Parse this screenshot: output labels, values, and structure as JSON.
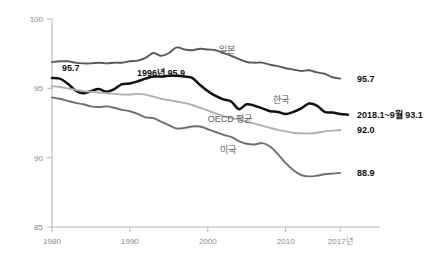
{
  "chart_data": {
    "type": "line",
    "title": "",
    "subtitle": "",
    "xlabel": "",
    "ylabel": "",
    "grid": false,
    "legend_position": "inline-series-labels",
    "xlim": [
      1980,
      2018
    ],
    "ylim": [
      85,
      100
    ],
    "x_tick_labels": [
      "1980",
      "1990",
      "2000",
      "2010",
      "2017년"
    ],
    "x_tick_values": [
      1980,
      1990,
      2000,
      2010,
      2017
    ],
    "y_tick_labels": [
      "100",
      "95",
      "90",
      "85"
    ],
    "y_tick_values": [
      100,
      95,
      90,
      85
    ],
    "annotations": [
      {
        "name": "korea-start-value",
        "text": "95.7",
        "x": 1982.4,
        "y": 96.45
      },
      {
        "name": "korea-peak-value",
        "text": "1996년 95.9",
        "x": 1994.0,
        "y": 96.1
      },
      {
        "name": "japan-end-value",
        "text": "95.7",
        "x": 2018.6,
        "y": 95.7
      },
      {
        "name": "korea-end-value",
        "text": "2018.1~9월 93.1",
        "x": 2018.6,
        "y": 93.1
      },
      {
        "name": "oecd-end-value",
        "text": "92.0",
        "x": 2018.6,
        "y": 92.0
      },
      {
        "name": "usa-end-value",
        "text": "88.9",
        "x": 2018.6,
        "y": 88.9
      }
    ],
    "series": [
      {
        "name": "japan",
        "label": "일본",
        "color": "#5a5a5a",
        "width": 1.9,
        "label_x": 2001.5,
        "label_y": 97.55,
        "x": [
          1980,
          1981,
          1982,
          1983,
          1984,
          1985,
          1986,
          1987,
          1988,
          1989,
          1990,
          1991,
          1992,
          1993,
          1994,
          1995,
          1996,
          1997,
          1998,
          1999,
          2000,
          2001,
          2002,
          2003,
          2004,
          2005,
          2006,
          2007,
          2008,
          2009,
          2010,
          2011,
          2012,
          2013,
          2014,
          2015,
          2016,
          2017
        ],
        "values": [
          96.9,
          96.95,
          96.95,
          96.85,
          96.8,
          96.8,
          96.85,
          96.8,
          96.85,
          96.85,
          96.95,
          97.0,
          97.2,
          97.55,
          97.35,
          97.55,
          97.95,
          97.8,
          97.75,
          97.85,
          97.8,
          97.75,
          97.55,
          97.35,
          97.1,
          96.9,
          96.85,
          96.85,
          96.7,
          96.6,
          96.45,
          96.35,
          96.25,
          96.3,
          96.15,
          96.05,
          95.8,
          95.7
        ]
      },
      {
        "name": "korea",
        "label": "한국",
        "color": "#111111",
        "width": 2.5,
        "label_x": 2008.4,
        "label_y": 93.95,
        "x": [
          1980,
          1981,
          1982,
          1983,
          1984,
          1985,
          1986,
          1987,
          1988,
          1989,
          1990,
          1991,
          1992,
          1993,
          1994,
          1995,
          1996,
          1997,
          1998,
          1999,
          2000,
          2001,
          2002,
          2003,
          2004,
          2005,
          2006,
          2007,
          2008,
          2009,
          2010,
          2011,
          2012,
          2013,
          2014,
          2015,
          2016,
          2017,
          2018
        ],
        "values": [
          95.75,
          95.7,
          95.35,
          94.85,
          94.65,
          94.8,
          94.95,
          94.75,
          94.95,
          95.3,
          95.35,
          95.5,
          95.7,
          95.85,
          95.85,
          95.9,
          95.9,
          95.85,
          95.75,
          95.25,
          94.8,
          94.45,
          94.2,
          94.05,
          93.5,
          93.85,
          93.75,
          93.55,
          93.35,
          93.3,
          93.15,
          93.3,
          93.55,
          93.9,
          93.75,
          93.3,
          93.25,
          93.15,
          93.1
        ]
      },
      {
        "name": "oecd_average",
        "label": "OECD 평균",
        "color": "#b0b0b0",
        "width": 1.9,
        "label_x": 2000.0,
        "label_y": 92.55,
        "x": [
          1980,
          1981,
          1982,
          1983,
          1984,
          1985,
          1986,
          1987,
          1988,
          1989,
          1990,
          1991,
          1992,
          1993,
          1994,
          1995,
          1996,
          1997,
          1998,
          1999,
          2000,
          2001,
          2002,
          2003,
          2004,
          2005,
          2006,
          2007,
          2008,
          2009,
          2010,
          2011,
          2012,
          2013,
          2014,
          2015,
          2016,
          2017
        ],
        "values": [
          95.15,
          95.1,
          95.0,
          94.9,
          94.8,
          94.75,
          94.7,
          94.65,
          94.6,
          94.55,
          94.55,
          94.6,
          94.55,
          94.4,
          94.25,
          94.15,
          94.05,
          93.95,
          93.8,
          93.6,
          93.4,
          93.2,
          93.0,
          92.85,
          92.75,
          92.6,
          92.45,
          92.3,
          92.15,
          92.0,
          91.9,
          91.8,
          91.75,
          91.75,
          91.8,
          91.9,
          91.95,
          92.0
        ]
      },
      {
        "name": "usa",
        "label": "미국",
        "color": "#6e6e6e",
        "width": 1.9,
        "label_x": 2001.6,
        "label_y": 90.35,
        "x": [
          1980,
          1981,
          1982,
          1983,
          1984,
          1985,
          1986,
          1987,
          1988,
          1989,
          1990,
          1991,
          1992,
          1993,
          1994,
          1995,
          1996,
          1997,
          1998,
          1999,
          2000,
          2001,
          2002,
          2003,
          2004,
          2005,
          2006,
          2007,
          2008,
          2009,
          2010,
          2011,
          2012,
          2013,
          2014,
          2015,
          2016,
          2017
        ],
        "values": [
          94.35,
          94.25,
          94.1,
          93.95,
          93.85,
          93.7,
          93.65,
          93.7,
          93.6,
          93.45,
          93.35,
          93.15,
          92.9,
          92.85,
          92.6,
          92.35,
          92.1,
          92.15,
          92.25,
          92.25,
          92.05,
          91.85,
          91.65,
          91.5,
          91.2,
          91.0,
          90.95,
          91.05,
          90.8,
          90.25,
          89.6,
          89.1,
          88.75,
          88.65,
          88.7,
          88.8,
          88.85,
          88.9
        ]
      }
    ]
  },
  "axis": {
    "y_axis_name": "y-axis",
    "x_axis_name": "x-axis"
  }
}
